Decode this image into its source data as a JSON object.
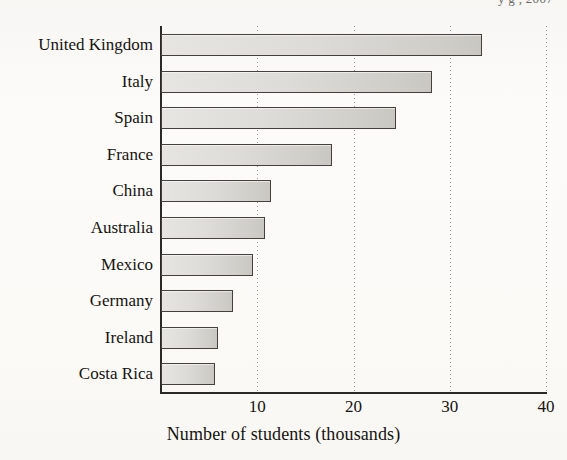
{
  "figure": {
    "title_cut_off": "y g , 2007",
    "background_color": "#fbfaf8",
    "bar_fill_color": "#dedcd8",
    "bar_border_color": "#44413c",
    "axis_color": "#2b2925"
  },
  "axis": {
    "x_caption": "Number of students (thousands)",
    "x_ticks": [
      "10",
      "20",
      "30",
      "40"
    ]
  },
  "chart_data": {
    "type": "bar",
    "orientation": "horizontal",
    "title": "",
    "xlabel": "Number of students (thousands)",
    "ylabel": "",
    "xlim": [
      0,
      40
    ],
    "xticks": [
      10,
      20,
      30,
      40
    ],
    "grid": "vertical-dotted",
    "legend": "none",
    "categories": [
      "United Kingdom",
      "Italy",
      "Spain",
      "France",
      "China",
      "Australia",
      "Mexico",
      "Germany",
      "Ireland",
      "Costa Rica"
    ],
    "values": [
      33.3,
      28.2,
      24.4,
      17.8,
      11.4,
      10.8,
      9.6,
      7.5,
      5.9,
      5.6
    ]
  }
}
